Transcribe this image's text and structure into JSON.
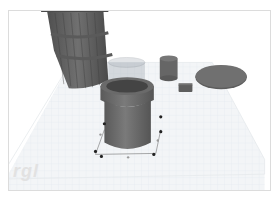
{
  "app": {
    "type": "3D modeling workplane viewport"
  },
  "viewport": {
    "background": "#ffffff",
    "workplane_color": "#f1f3f5",
    "grid_color": "#dde3ea",
    "object_color": "#6b6b6b",
    "watermark_text": "rgl"
  },
  "objects": [
    {
      "name": "barrel",
      "selected": false
    },
    {
      "name": "pot",
      "selected": true
    },
    {
      "name": "small-cylinder",
      "selected": false
    },
    {
      "name": "small-box",
      "selected": false
    },
    {
      "name": "flat-disc",
      "selected": false
    }
  ],
  "selection": {
    "handle_color": "#222222",
    "handle_secondary_color": "#9a9a9a"
  }
}
